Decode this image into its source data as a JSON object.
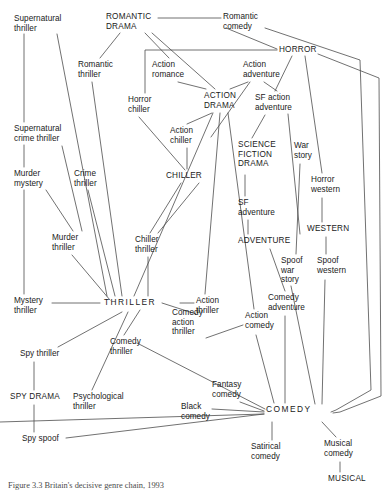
{
  "figure": {
    "caption": "Figure  3.3  Britain's decisive genre chain, 1993",
    "width": 390,
    "height": 494,
    "line_color": "#4d4d4d",
    "text_color": "#1a1a1a"
  },
  "nodes": [
    {
      "id": "supernatural_thriller",
      "label": "Supernatural\nthriller",
      "x": 14,
      "y": 14,
      "align": "left"
    },
    {
      "id": "romantic_drama",
      "label": "ROMANTIC\nDRAMA",
      "x": 106,
      "y": 12,
      "align": "left"
    },
    {
      "id": "romantic_comedy",
      "label": "Romantic\ncomedy",
      "x": 223,
      "y": 12,
      "align": "left"
    },
    {
      "id": "horror",
      "label": "HORROR",
      "x": 279,
      "y": 45,
      "align": "left"
    },
    {
      "id": "romantic_thriller",
      "label": "Romantic\nthriller",
      "x": 78,
      "y": 60,
      "align": "left"
    },
    {
      "id": "action_romance",
      "label": "Action\nromance",
      "x": 152,
      "y": 60,
      "align": "left"
    },
    {
      "id": "action_adventure",
      "label": "Action\nadventure",
      "x": 243,
      "y": 60,
      "align": "left"
    },
    {
      "id": "horror_chiller",
      "label": "Horror\nchiller",
      "x": 128,
      "y": 95,
      "align": "left"
    },
    {
      "id": "action_drama",
      "label": "ACTION\nDRAMA",
      "x": 204,
      "y": 91,
      "align": "left"
    },
    {
      "id": "sf_action_adventure",
      "label": "SF action\nadventure",
      "x": 255,
      "y": 93,
      "align": "left"
    },
    {
      "id": "supernatural_crime_thriller",
      "label": "Supernatural\ncrime thriller",
      "x": 14,
      "y": 124,
      "align": "left"
    },
    {
      "id": "action_chiller",
      "label": "Action\nchiller",
      "x": 170,
      "y": 126,
      "align": "left"
    },
    {
      "id": "science_fiction_drama",
      "label": "SCIENCE\nFICTION\nDRAMA",
      "x": 238,
      "y": 140,
      "align": "left"
    },
    {
      "id": "war_story",
      "label": "War\nstory",
      "x": 294,
      "y": 141,
      "align": "left"
    },
    {
      "id": "murder_mystery",
      "label": "Murder\nmystery",
      "x": 14,
      "y": 169,
      "align": "left"
    },
    {
      "id": "crime_thriller",
      "label": "Crime\nthriller",
      "x": 74,
      "y": 169,
      "align": "left"
    },
    {
      "id": "chiller",
      "label": "CHILLER",
      "x": 166,
      "y": 171,
      "align": "left"
    },
    {
      "id": "horror_western",
      "label": "Horror\nwestern",
      "x": 311,
      "y": 175,
      "align": "left"
    },
    {
      "id": "sf_adventure",
      "label": "SF\nadventure",
      "x": 238,
      "y": 198,
      "align": "left"
    },
    {
      "id": "western",
      "label": "WESTERN",
      "x": 307,
      "y": 224,
      "align": "left"
    },
    {
      "id": "murder_thriller",
      "label": "Murder\nthriller",
      "x": 52,
      "y": 233,
      "align": "left"
    },
    {
      "id": "chiller_thriller",
      "label": "Chiller\nthriller",
      "x": 135,
      "y": 235,
      "align": "left"
    },
    {
      "id": "adventure",
      "label": "ADVENTURE",
      "x": 238,
      "y": 236,
      "align": "left"
    },
    {
      "id": "spoof_war_story",
      "label": "Spoof\nwar\nstory",
      "x": 281,
      "y": 256,
      "align": "left"
    },
    {
      "id": "spoof_western",
      "label": "Spoof\nwestern",
      "x": 317,
      "y": 256,
      "align": "left"
    },
    {
      "id": "mystery_thriller",
      "label": "Mystery\nthriller",
      "x": 14,
      "y": 296,
      "align": "left"
    },
    {
      "id": "thriller",
      "label": "THRILLER",
      "x": 104,
      "y": 298,
      "align": "left"
    },
    {
      "id": "action_thriller",
      "label": "Action\nthriller",
      "x": 196,
      "y": 296,
      "align": "left"
    },
    {
      "id": "comedy_adventure",
      "label": "Comedy\nadventure",
      "x": 268,
      "y": 293,
      "align": "left"
    },
    {
      "id": "spy_thriller",
      "label": "Spy thriller",
      "x": 20,
      "y": 349,
      "align": "left"
    },
    {
      "id": "comedy_thriller",
      "label": "Comedy\nthriller",
      "x": 110,
      "y": 337,
      "align": "left"
    },
    {
      "id": "comedy_action_thriller",
      "label": "Comedy\naction\nthriller",
      "x": 172,
      "y": 308,
      "align": "left"
    },
    {
      "id": "action_comedy",
      "label": "Action\ncomedy",
      "x": 245,
      "y": 311,
      "align": "left"
    },
    {
      "id": "spy_drama",
      "label": "SPY DRAMA",
      "x": 10,
      "y": 392,
      "align": "left"
    },
    {
      "id": "psychological_thriller",
      "label": "Psychological\nthriller",
      "x": 73,
      "y": 392,
      "align": "left"
    },
    {
      "id": "fantasy_comedy",
      "label": "Fantasy\ncomedy",
      "x": 212,
      "y": 380,
      "align": "left"
    },
    {
      "id": "black_comedy",
      "label": "Black\ncomedy",
      "x": 181,
      "y": 402,
      "align": "left"
    },
    {
      "id": "comedy",
      "label": "COMEDY",
      "x": 266,
      "y": 405,
      "align": "left"
    },
    {
      "id": "spy_spoof",
      "label": "Spy spoof",
      "x": 22,
      "y": 434,
      "align": "left"
    },
    {
      "id": "satirical_comedy",
      "label": "Satirical\ncomedy",
      "x": 251,
      "y": 442,
      "align": "left"
    },
    {
      "id": "musical_comedy",
      "label": "Musical\ncomedy",
      "x": 324,
      "y": 439,
      "align": "left"
    },
    {
      "id": "musical",
      "label": "MUSICAL",
      "x": 328,
      "y": 474,
      "align": "left"
    }
  ],
  "edges": [
    {
      "from": "supernatural_thriller",
      "to": "supernatural_crime_thriller",
      "path": "M 24,34 L 24,122"
    },
    {
      "from": "supernatural_crime_thriller",
      "to": "murder_mystery",
      "path": "M 24,145 L 24,167"
    },
    {
      "from": "murder_mystery",
      "to": "mystery_thriller",
      "path": "M 24,190 L 24,294"
    },
    {
      "from": "mystery_thriller",
      "to": "thriller",
      "path": "M 52,303 L 100,303"
    },
    {
      "from": "supernatural_thriller",
      "to": "thriller",
      "path": "M 57,34 L 107,296"
    },
    {
      "from": "supernatural_crime_thriller",
      "to": "murder_thriller",
      "path": "M 62,146 L 82,231"
    },
    {
      "from": "murder_mystery",
      "to": "murder_thriller",
      "path": "M 46,190 L 73,231"
    },
    {
      "from": "murder_thriller",
      "to": "thriller",
      "path": "M 72,255 L 110,300"
    },
    {
      "from": "crime_thriller",
      "to": "thriller",
      "path": "M 88,190 L 115,296"
    },
    {
      "from": "romantic_thriller",
      "to": "thriller",
      "path": "M 92,82 L 122,296"
    },
    {
      "from": "romantic_drama",
      "to": "romantic_thriller",
      "path": "M 120,33 L 100,58"
    },
    {
      "from": "romantic_drama",
      "to": "romantic_comedy",
      "path": "M 158,18 L 221,18"
    },
    {
      "from": "romantic_drama",
      "to": "action_romance",
      "path": "M 145,33 L 169,58"
    },
    {
      "from": "romantic_drama",
      "to": "action_drama",
      "path": "M 152,33 L 215,89"
    },
    {
      "from": "romantic_comedy",
      "to": "horror",
      "path": "M 226,28 L 277,49"
    },
    {
      "from": "romantic_comedy",
      "to": "comedy",
      "path": "M 265,28 L 360,60 L 371,390 L 336,410 L 331,412"
    },
    {
      "from": "horror",
      "to": "horror_chiller",
      "path": "M 277,50 L 145,50 L 145,93"
    },
    {
      "from": "horror",
      "to": "sf_action_adventure",
      "path": "M 292,56 L 275,91"
    },
    {
      "from": "horror",
      "to": "horror_western",
      "path": "M 305,56 L 322,173"
    },
    {
      "from": "horror",
      "to": "comedy",
      "path": "M 318,54 L 379,78 L 381,396 L 340,412 L 333,413"
    },
    {
      "from": "action_romance",
      "to": "action_drama",
      "path": "M 178,82 L 206,89"
    },
    {
      "from": "action_adventure",
      "to": "action_drama",
      "path": "M 248,82 L 230,89"
    },
    {
      "from": "action_adventure",
      "to": "science_fiction_drama",
      "path": "M 250,82 L 211,137"
    },
    {
      "from": "action_adventure",
      "to": "sf_action_adventure",
      "path": "M 264,82 L 277,91"
    },
    {
      "from": "action_drama",
      "to": "action_chiller",
      "path": "M 212,113 L 187,124"
    },
    {
      "from": "action_chiller",
      "to": "chiller",
      "path": "M 187,148 L 187,169"
    },
    {
      "from": "horror_chiller",
      "to": "chiller",
      "path": "M 139,117 L 185,170"
    },
    {
      "from": "chiller",
      "to": "chiller_thriller",
      "path": "M 181,183 L 150,233"
    },
    {
      "from": "chiller",
      "to": "chiller_thriller",
      "path": "M 199,183 L 158,233"
    },
    {
      "from": "chiller_thriller",
      "to": "thriller",
      "path": "M 148,257 L 148,296"
    },
    {
      "from": "action_drama",
      "to": "thriller",
      "path": "M 213,113 L 134,296"
    },
    {
      "from": "action_drama",
      "to": "action_thriller",
      "path": "M 220,113 L 205,294"
    },
    {
      "from": "action_drama",
      "to": "action_comedy",
      "path": "M 228,113 L 254,309"
    },
    {
      "from": "sf_action_adventure",
      "to": "adventure",
      "path": "M 288,114 L 300,234"
    },
    {
      "from": "sf_action_adventure",
      "to": "science_fiction_drama",
      "path": "M 265,115 L 252,138"
    },
    {
      "from": "science_fiction_drama",
      "to": "sf_adventure",
      "path": "M 245,175 L 245,196"
    },
    {
      "from": "sf_adventure",
      "to": "adventure",
      "path": "M 248,220 L 248,234"
    },
    {
      "from": "war_story",
      "to": "spoof_war_story",
      "path": "M 300,164 L 296,254"
    },
    {
      "from": "horror_western",
      "to": "western",
      "path": "M 322,198 L 322,222"
    },
    {
      "from": "western",
      "to": "spoof_western",
      "path": "M 326,237 L 326,254"
    },
    {
      "from": "adventure",
      "to": "comedy_adventure",
      "path": "M 270,249 L 285,291"
    },
    {
      "from": "comedy_adventure",
      "to": "comedy",
      "path": "M 285,316 L 285,403"
    },
    {
      "from": "spoof_war_story",
      "to": "comedy",
      "path": "M 291,286 L 315,404"
    },
    {
      "from": "spoof_western",
      "to": "comedy",
      "path": "M 325,280 L 322,404"
    },
    {
      "from": "action_thriller",
      "to": "thriller",
      "path": "M 194,303 L 180,303"
    },
    {
      "from": "thriller",
      "to": "comedy_action_thriller",
      "path": "M 162,303 L 196,314"
    },
    {
      "from": "thriller",
      "to": "comedy_thriller",
      "path": "M 140,310 L 124,335"
    },
    {
      "from": "thriller",
      "to": "psychological_thriller",
      "path": "M 128,312 L 92,390"
    },
    {
      "from": "thriller",
      "to": "spy_thriller",
      "path": "M 122,312 L 58,347"
    },
    {
      "from": "comedy_action_thriller",
      "to": "action_comedy",
      "path": "M 206,338 L 243,325"
    },
    {
      "from": "comedy_thriller",
      "to": "comedy",
      "path": "M 137,343 L 265,409"
    },
    {
      "from": "action_comedy",
      "to": "comedy",
      "path": "M 256,335 L 274,403"
    },
    {
      "from": "spy_thriller",
      "to": "spy_drama",
      "path": "M 34,362 L 34,390"
    },
    {
      "from": "spy_drama",
      "to": "spy_spoof",
      "path": "M 34,405 L 34,432"
    },
    {
      "from": "spy_spoof",
      "to": "comedy",
      "path": "M 66,438 L 264,414"
    },
    {
      "from": "fantasy_comedy",
      "to": "comedy",
      "path": "M 240,402 L 264,411"
    },
    {
      "from": "black_comedy",
      "to": "comedy",
      "path": "M 212,409 L 264,412"
    },
    {
      "from": "black_comedy",
      "to": "comedy",
      "path": "M 0,422 L 264,414"
    },
    {
      "from": "comedy",
      "to": "satirical_comedy",
      "path": "M 272,422 L 272,440"
    },
    {
      "from": "comedy",
      "to": "musical_comedy",
      "path": "M 322,422 L 336,437"
    },
    {
      "from": "musical_comedy",
      "to": "musical",
      "path": "M 340,462 L 340,472"
    }
  ]
}
